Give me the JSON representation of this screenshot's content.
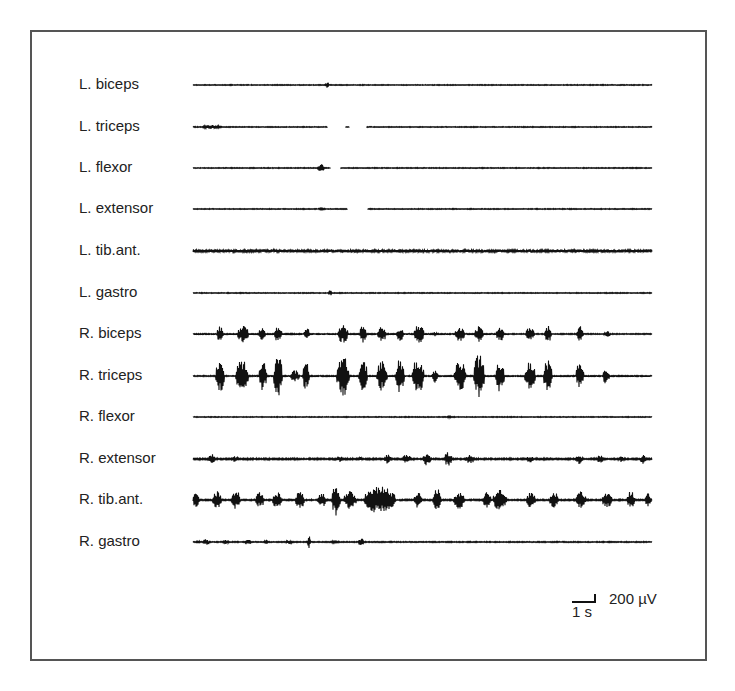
{
  "chart_data": {
    "type": "line",
    "title": "",
    "xlabel": "",
    "ylabel": "",
    "grid": false,
    "legend": null,
    "x_range_px": [
      193,
      652
    ],
    "channels": [
      {
        "name": "L. biceps",
        "y": 85,
        "noise": 0.4,
        "bursts": [
          {
            "x": 327,
            "w": 3,
            "a": 3
          }
        ]
      },
      {
        "name": "L. triceps",
        "y": 127,
        "noise": 0.4,
        "bursts": [
          {
            "x": 212,
            "w": 18,
            "a": 2
          }
        ],
        "gaps": [
          [
            328,
            345
          ],
          [
            350,
            366
          ]
        ]
      },
      {
        "name": "L. flexor",
        "y": 168,
        "noise": 0.4,
        "bursts": [
          {
            "x": 321,
            "w": 6,
            "a": 4
          }
        ],
        "gaps": [
          [
            331,
            340
          ]
        ]
      },
      {
        "name": "L. extensor",
        "y": 209,
        "noise": 0.4,
        "bursts": [
          {
            "x": 322,
            "w": 8,
            "a": 1
          }
        ],
        "gaps": [
          [
            348,
            367
          ]
        ]
      },
      {
        "name": "L. tib.ant.",
        "y": 251,
        "noise": 1.6,
        "bursts": []
      },
      {
        "name": "L. gastro",
        "y": 293,
        "noise": 0.4,
        "bursts": [
          {
            "x": 330,
            "w": 3,
            "a": 3
          }
        ]
      },
      {
        "name": "R. biceps",
        "y": 334,
        "noise": 0.5,
        "bursts": [
          {
            "x": 220,
            "w": 6,
            "a": 8
          },
          {
            "x": 243,
            "w": 10,
            "a": 9
          },
          {
            "x": 262,
            "w": 6,
            "a": 7
          },
          {
            "x": 278,
            "w": 7,
            "a": 8
          },
          {
            "x": 307,
            "w": 5,
            "a": 7
          },
          {
            "x": 343,
            "w": 9,
            "a": 10
          },
          {
            "x": 363,
            "w": 6,
            "a": 9
          },
          {
            "x": 382,
            "w": 8,
            "a": 8
          },
          {
            "x": 400,
            "w": 7,
            "a": 7
          },
          {
            "x": 419,
            "w": 9,
            "a": 10
          },
          {
            "x": 435,
            "w": 3,
            "a": 3
          },
          {
            "x": 460,
            "w": 9,
            "a": 8
          },
          {
            "x": 479,
            "w": 8,
            "a": 8
          },
          {
            "x": 500,
            "w": 7,
            "a": 8
          },
          {
            "x": 530,
            "w": 8,
            "a": 7
          },
          {
            "x": 548,
            "w": 6,
            "a": 9
          },
          {
            "x": 580,
            "w": 6,
            "a": 8
          },
          {
            "x": 607,
            "w": 6,
            "a": 3
          }
        ]
      },
      {
        "name": "R. triceps",
        "y": 376,
        "noise": 0.5,
        "bursts": [
          {
            "x": 220,
            "w": 8,
            "a": 17
          },
          {
            "x": 242,
            "w": 12,
            "a": 17
          },
          {
            "x": 263,
            "w": 7,
            "a": 15
          },
          {
            "x": 278,
            "w": 8,
            "a": 22
          },
          {
            "x": 295,
            "w": 8,
            "a": 6
          },
          {
            "x": 306,
            "w": 6,
            "a": 15
          },
          {
            "x": 343,
            "w": 12,
            "a": 22
          },
          {
            "x": 363,
            "w": 8,
            "a": 18
          },
          {
            "x": 382,
            "w": 10,
            "a": 16
          },
          {
            "x": 400,
            "w": 8,
            "a": 18
          },
          {
            "x": 418,
            "w": 11,
            "a": 18
          },
          {
            "x": 435,
            "w": 5,
            "a": 7
          },
          {
            "x": 460,
            "w": 11,
            "a": 16
          },
          {
            "x": 479,
            "w": 10,
            "a": 22
          },
          {
            "x": 500,
            "w": 8,
            "a": 16
          },
          {
            "x": 530,
            "w": 10,
            "a": 14
          },
          {
            "x": 548,
            "w": 8,
            "a": 18
          },
          {
            "x": 580,
            "w": 7,
            "a": 15
          },
          {
            "x": 606,
            "w": 6,
            "a": 8
          }
        ]
      },
      {
        "name": "R. flexor",
        "y": 417,
        "noise": 0.4,
        "bursts": [
          {
            "x": 449,
            "w": 3,
            "a": 2
          }
        ]
      },
      {
        "name": "R. extensor",
        "y": 459,
        "noise": 0.8,
        "bursts": [
          {
            "x": 212,
            "w": 6,
            "a": 5
          },
          {
            "x": 235,
            "w": 8,
            "a": 3
          },
          {
            "x": 340,
            "w": 5,
            "a": 3
          },
          {
            "x": 361,
            "w": 4,
            "a": 2
          },
          {
            "x": 388,
            "w": 6,
            "a": 5
          },
          {
            "x": 407,
            "w": 8,
            "a": 5
          },
          {
            "x": 427,
            "w": 7,
            "a": 7
          },
          {
            "x": 448,
            "w": 7,
            "a": 7
          },
          {
            "x": 470,
            "w": 8,
            "a": 5
          },
          {
            "x": 530,
            "w": 6,
            "a": 4
          },
          {
            "x": 579,
            "w": 7,
            "a": 5
          },
          {
            "x": 600,
            "w": 6,
            "a": 4
          },
          {
            "x": 621,
            "w": 6,
            "a": 3
          },
          {
            "x": 643,
            "w": 5,
            "a": 5
          }
        ]
      },
      {
        "name": "R. tib.ant.",
        "y": 500,
        "noise": 0.7,
        "bursts": [
          {
            "x": 196,
            "w": 6,
            "a": 8
          },
          {
            "x": 217,
            "w": 8,
            "a": 9
          },
          {
            "x": 236,
            "w": 8,
            "a": 10
          },
          {
            "x": 260,
            "w": 8,
            "a": 8
          },
          {
            "x": 277,
            "w": 8,
            "a": 9
          },
          {
            "x": 300,
            "w": 8,
            "a": 10
          },
          {
            "x": 322,
            "w": 8,
            "a": 7
          },
          {
            "x": 336,
            "w": 8,
            "a": 16
          },
          {
            "x": 350,
            "w": 12,
            "a": 9
          },
          {
            "x": 380,
            "w": 30,
            "a": 14
          },
          {
            "x": 418,
            "w": 7,
            "a": 8
          },
          {
            "x": 437,
            "w": 8,
            "a": 12
          },
          {
            "x": 459,
            "w": 10,
            "a": 9
          },
          {
            "x": 487,
            "w": 8,
            "a": 8
          },
          {
            "x": 500,
            "w": 13,
            "a": 12
          },
          {
            "x": 531,
            "w": 8,
            "a": 8
          },
          {
            "x": 554,
            "w": 8,
            "a": 9
          },
          {
            "x": 581,
            "w": 9,
            "a": 9
          },
          {
            "x": 607,
            "w": 9,
            "a": 8
          },
          {
            "x": 631,
            "w": 7,
            "a": 9
          },
          {
            "x": 648,
            "w": 6,
            "a": 8
          }
        ]
      },
      {
        "name": "R. gastro",
        "y": 542,
        "noise": 0.5,
        "bursts": [
          {
            "x": 198,
            "w": 4,
            "a": 2
          },
          {
            "x": 206,
            "w": 6,
            "a": 3
          },
          {
            "x": 226,
            "w": 6,
            "a": 2
          },
          {
            "x": 248,
            "w": 6,
            "a": 3
          },
          {
            "x": 266,
            "w": 3,
            "a": 4
          },
          {
            "x": 289,
            "w": 6,
            "a": 2
          },
          {
            "x": 309,
            "w": 3,
            "a": 6
          },
          {
            "x": 335,
            "w": 10,
            "a": 1
          },
          {
            "x": 361,
            "w": 5,
            "a": 4
          }
        ]
      }
    ],
    "scale_bar": {
      "voltage_label": "200 µV",
      "time_label": "1 s",
      "time_px": 23,
      "voltage_px": 8
    }
  },
  "colors": {
    "trace": "#111111",
    "frame": "#555555",
    "text": "#222222"
  }
}
